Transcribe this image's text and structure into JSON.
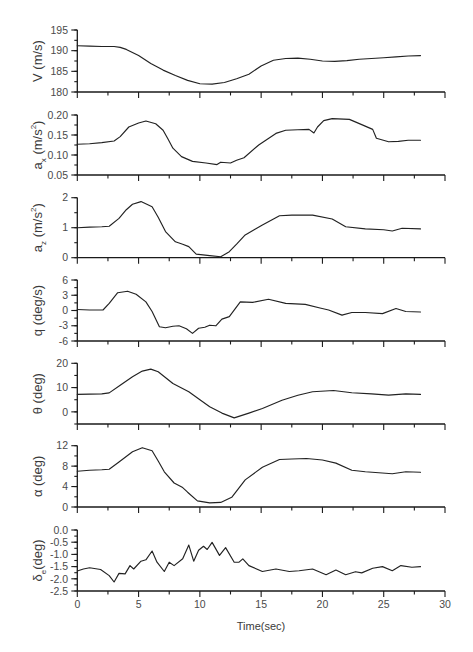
{
  "figure": {
    "xaxis": {
      "title": "Time(sec)",
      "xlim": [
        0,
        30
      ],
      "major_ticks": [
        0,
        5,
        10,
        15,
        20,
        25,
        30
      ],
      "tick_labels": [
        "0",
        "5",
        "10",
        "15",
        "20",
        "25",
        "30"
      ],
      "minor_step": 2.5
    }
  },
  "chart_data": [
    {
      "type": "line",
      "ylabel": "V (m/s)",
      "ylabel_parts": [
        {
          "t": "V (m/s)"
        }
      ],
      "ylim": [
        180,
        195
      ],
      "yticks": [
        180,
        185,
        190,
        195
      ],
      "ytick_labels": [
        "180",
        "185",
        "190",
        "195"
      ],
      "minor_step": 2.5,
      "x": [
        0,
        1,
        2,
        3,
        3.5,
        4,
        5,
        6,
        7,
        8,
        9,
        10,
        11,
        12,
        13,
        14,
        15,
        16,
        17,
        18,
        19,
        20,
        21,
        22,
        23,
        24,
        25,
        26,
        27,
        28
      ],
      "values": [
        191.2,
        191.1,
        191.0,
        191.0,
        190.8,
        190.3,
        188.8,
        186.9,
        185.3,
        184.0,
        182.8,
        182.0,
        181.9,
        182.3,
        183.2,
        184.3,
        186.3,
        187.7,
        188.1,
        188.2,
        187.9,
        187.5,
        187.4,
        187.6,
        187.9,
        188.1,
        188.3,
        188.5,
        188.7,
        188.8
      ]
    },
    {
      "type": "line",
      "ylabel": "a_x (m/s^2)",
      "ylabel_parts": [
        {
          "t": "a"
        },
        {
          "t": "x",
          "sub": true
        },
        {
          "t": " (m/s"
        },
        {
          "t": "2",
          "sup": true
        },
        {
          "t": ")"
        }
      ],
      "ylim": [
        0.05,
        0.2
      ],
      "yticks": [
        0.05,
        0.1,
        0.15,
        0.2
      ],
      "ytick_labels": [
        "0.05",
        "0.10",
        "0.15",
        "0.20"
      ],
      "minor_step": 0.025,
      "x": [
        0,
        1,
        2,
        3,
        3.5,
        4.2,
        5,
        5.6,
        6.4,
        7,
        7.4,
        7.8,
        8.5,
        9.4,
        10.5,
        11.4,
        11.7,
        12.5,
        13,
        13.6,
        14.8,
        16.2,
        17,
        18,
        18.9,
        19.3,
        19.6,
        20.1,
        20.8,
        22.2,
        23.2,
        24.1,
        24.4,
        25.4,
        26.2,
        27,
        28
      ],
      "values": [
        0.127,
        0.128,
        0.131,
        0.135,
        0.146,
        0.17,
        0.18,
        0.185,
        0.178,
        0.162,
        0.14,
        0.117,
        0.096,
        0.084,
        0.08,
        0.076,
        0.082,
        0.08,
        0.087,
        0.093,
        0.125,
        0.154,
        0.162,
        0.163,
        0.164,
        0.155,
        0.17,
        0.186,
        0.191,
        0.189,
        0.176,
        0.164,
        0.142,
        0.133,
        0.134,
        0.137,
        0.137
      ]
    },
    {
      "type": "line",
      "ylabel": "a_z (m/s^2)",
      "ylabel_parts": [
        {
          "t": "a"
        },
        {
          "t": "z",
          "sub": true
        },
        {
          "t": " (m/s"
        },
        {
          "t": "2",
          "sup": true
        },
        {
          "t": ")"
        }
      ],
      "ylim": [
        0,
        2
      ],
      "yticks": [
        0,
        1,
        2
      ],
      "ytick_labels": [
        "0",
        "1",
        "2"
      ],
      "minor_step": 0.5,
      "x": [
        0,
        1,
        2,
        2.6,
        3.4,
        4,
        4.5,
        5.2,
        6.1,
        6.6,
        7.2,
        8.0,
        8.6,
        9.1,
        9.7,
        10.8,
        11.7,
        12.4,
        13,
        13.7,
        14.5,
        15.1,
        16.5,
        17.5,
        19.2,
        20.8,
        21.9,
        23.5,
        25,
        25.7,
        26.5,
        28
      ],
      "values": [
        1.0,
        1.02,
        1.03,
        1.05,
        1.31,
        1.6,
        1.78,
        1.87,
        1.7,
        1.35,
        0.87,
        0.53,
        0.45,
        0.37,
        0.12,
        0.07,
        0.03,
        0.2,
        0.45,
        0.76,
        0.95,
        1.09,
        1.4,
        1.42,
        1.42,
        1.29,
        1.03,
        0.96,
        0.93,
        0.89,
        0.98,
        0.96
      ]
    },
    {
      "type": "line",
      "ylabel": "q (deg/s)",
      "ylabel_parts": [
        {
          "t": "q (deg/s)"
        }
      ],
      "ylim": [
        -6,
        6
      ],
      "yticks": [
        -6,
        -3,
        0,
        3,
        6
      ],
      "ytick_labels": [
        "-6",
        "-3",
        "0",
        "3",
        "6"
      ],
      "minor_step": 1.5,
      "x": [
        0,
        1,
        2.1,
        2.6,
        3.3,
        4.1,
        4.8,
        5.6,
        6.1,
        6.7,
        7.2,
        7.8,
        8.3,
        8.9,
        9.4,
        9.9,
        10.4,
        10.8,
        11.3,
        11.8,
        12.4,
        13.3,
        14.3,
        15.6,
        17,
        18.6,
        19.8,
        20.5,
        21.6,
        22.4,
        23.5,
        24.9,
        26,
        26.8,
        28
      ],
      "values": [
        0.2,
        0.1,
        0.1,
        1.4,
        3.5,
        3.8,
        3.2,
        1.7,
        -0.2,
        -3.2,
        -3.4,
        -3.1,
        -3.0,
        -3.6,
        -4.5,
        -3.5,
        -3.3,
        -2.9,
        -3.0,
        -1.7,
        -1.2,
        1.7,
        1.6,
        2.2,
        1.4,
        1.2,
        0.5,
        0.1,
        -0.9,
        -0.4,
        -0.4,
        -0.6,
        0.4,
        -0.2,
        -0.3
      ]
    },
    {
      "type": "line",
      "ylabel": "θ (deg)",
      "ylabel_parts": [
        {
          "t": "θ (deg)"
        }
      ],
      "ylim": [
        -5,
        20
      ],
      "yticks": [
        0,
        10,
        20
      ],
      "ytick_labels": [
        "0",
        "10",
        "20"
      ],
      "minor_step": 5,
      "x": [
        0,
        1,
        2,
        2.6,
        3.5,
        4.5,
        5.3,
        6.0,
        6.6,
        7.8,
        9.1,
        10,
        10.8,
        11.8,
        12.8,
        14,
        15.1,
        16.7,
        18,
        19.2,
        20.9,
        22.4,
        24,
        25.4,
        26.8,
        28
      ],
      "values": [
        7.2,
        7.3,
        7.4,
        7.8,
        11,
        14.5,
        16.8,
        17.6,
        16.5,
        11.7,
        8.3,
        5,
        2.1,
        -0.5,
        -2.5,
        -0.5,
        1.4,
        4.8,
        6.8,
        8.3,
        8.8,
        7.9,
        7.4,
        6.9,
        7.4,
        7.2
      ]
    },
    {
      "type": "line",
      "ylabel": "α (deg)",
      "ylabel_parts": [
        {
          "t": "α (deg)"
        }
      ],
      "ylim": [
        0,
        12
      ],
      "yticks": [
        0,
        4,
        8,
        12
      ],
      "ytick_labels": [
        "0",
        "4",
        "8",
        "12"
      ],
      "minor_step": 2,
      "x": [
        0,
        1,
        2,
        2.6,
        3.4,
        4.5,
        5.3,
        6.1,
        6.6,
        7.1,
        7.9,
        8.6,
        9.0,
        9.8,
        10.8,
        11.7,
        12.6,
        13.7,
        15.1,
        16.5,
        17.5,
        18.7,
        20,
        21.1,
        22.4,
        23.5,
        25.7,
        26.8,
        28
      ],
      "values": [
        7.0,
        7.2,
        7.3,
        7.4,
        8.8,
        10.8,
        11.6,
        11.0,
        9.0,
        6.9,
        4.7,
        3.8,
        2.9,
        1.2,
        0.8,
        0.9,
        1.9,
        5.3,
        7.8,
        9.3,
        9.4,
        9.5,
        9.2,
        8.6,
        7.2,
        6.9,
        6.5,
        6.9,
        6.8
      ]
    },
    {
      "type": "line",
      "ylabel": "δ_e (deg)",
      "ylabel_parts": [
        {
          "t": "δ"
        },
        {
          "t": "e",
          "sub": true
        },
        {
          "t": "(deg)"
        }
      ],
      "ylim": [
        -2.5,
        0.0
      ],
      "yticks": [
        -2.5,
        -2.0,
        -1.5,
        -1.0,
        -0.5,
        0.0
      ],
      "ytick_labels": [
        "-2.5",
        "-2.0",
        "-1.5",
        "-1.0",
        "-0.5",
        "0.0"
      ],
      "minor_step": 0.25,
      "x": [
        0,
        0.5,
        1,
        1.9,
        2.6,
        3.0,
        3.4,
        3.9,
        4.3,
        4.6,
        5.2,
        5.6,
        6.1,
        6.5,
        7.1,
        7.5,
        7.9,
        8.6,
        9.1,
        9.5,
        9.9,
        10.3,
        10.6,
        11.0,
        11.6,
        12.1,
        12.8,
        13.2,
        13.5,
        14.0,
        15.1,
        16.2,
        17.3,
        18.1,
        19.2,
        20.3,
        21.1,
        21.9,
        22.7,
        23.2,
        24.1,
        24.9,
        25.7,
        26.4,
        27.3,
        28
      ],
      "values": [
        -1.68,
        -1.6,
        -1.55,
        -1.62,
        -1.87,
        -2.13,
        -1.78,
        -1.8,
        -1.46,
        -1.6,
        -1.28,
        -1.22,
        -0.86,
        -1.32,
        -1.7,
        -1.32,
        -1.46,
        -1.18,
        -0.62,
        -1.28,
        -0.83,
        -0.67,
        -0.8,
        -0.51,
        -1.04,
        -0.72,
        -1.32,
        -1.32,
        -1.18,
        -1.46,
        -1.7,
        -1.6,
        -1.7,
        -1.67,
        -1.6,
        -1.83,
        -1.64,
        -1.83,
        -1.71,
        -1.76,
        -1.57,
        -1.5,
        -1.67,
        -1.46,
        -1.53,
        -1.5
      ]
    }
  ]
}
